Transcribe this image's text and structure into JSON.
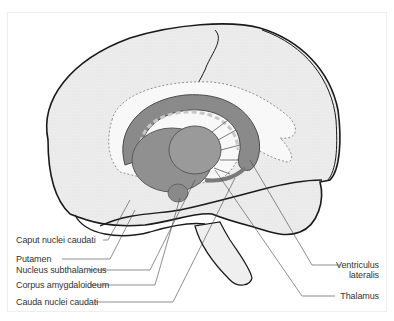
{
  "figure": {
    "colors": {
      "brain_fill": "#efefef",
      "brain_outline": "#1a1a1a",
      "nuclei_fill": "#8a8a8a",
      "nuclei_dark": "#6a6a6a",
      "nuclei_light": "#a8a8a8",
      "leader_line": "#444444",
      "text": "#333333"
    },
    "labels_left": [
      {
        "text": "Caput nuclei caudati"
      },
      {
        "text": "Putamen"
      },
      {
        "text": "Nucleus subthalamicus"
      },
      {
        "text": "Corpus amygdaloideum"
      },
      {
        "text": "Cauda nuclei caudati"
      }
    ],
    "labels_right": [
      {
        "text": "Ventriculus",
        "text2": "lateralis"
      },
      {
        "text": "Thalamus"
      }
    ]
  }
}
